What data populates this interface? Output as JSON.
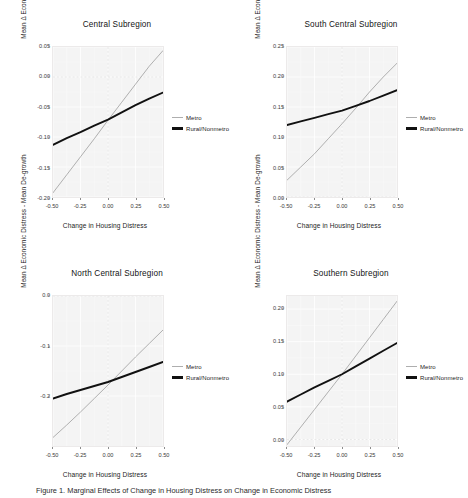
{
  "figure": {
    "background": "#ffffff",
    "caption": "Figure 1. Marginal Effects of Change in Housing Distress on Change in Economic Distress"
  },
  "legend": {
    "position": "right",
    "entries": [
      {
        "label": "Metro",
        "color": "#aeaeae",
        "style": "thin"
      },
      {
        "label": "Rural/Nonmetro",
        "color": "#111111",
        "style": "thick"
      }
    ]
  },
  "axis_titles": {
    "x": "Change in Housing Distress",
    "y": "Mean Δ Economic Distress - Mean De-growth"
  },
  "chart_data": [
    {
      "type": "line",
      "title": "Central Subregion",
      "xlabel": "Change in Housing Distress",
      "ylabel": "Mean Δ Economic Distress - Mean De-growth",
      "xlim": [
        -0.5,
        0.5
      ],
      "ylim": [
        -0.2,
        0.05
      ],
      "xticks": [
        "-0.50",
        "-0.25",
        "0.00",
        "0.25",
        "0.50"
      ],
      "xtickvalues": [
        -0.5,
        -0.25,
        0,
        0.25,
        0.5
      ],
      "yticks": [
        "0.05",
        "0.00",
        "-0.05",
        "-0.10",
        "-0.15",
        "-0.20"
      ],
      "ytickvalues": [
        0.05,
        0,
        -0.05,
        -0.1,
        -0.15,
        -0.2
      ],
      "grid": true,
      "legend": "right",
      "series": [
        {
          "name": "Metro",
          "color": "#aeaeae",
          "x": [
            -0.5,
            -0.375,
            -0.25,
            -0.125,
            0.0,
            0.125,
            0.25,
            0.375,
            0.5
          ],
          "values": [
            -0.193,
            -0.163,
            -0.133,
            -0.103,
            -0.072,
            -0.042,
            -0.012,
            0.018,
            0.044
          ]
        },
        {
          "name": "Rural/Nonmetro",
          "color": "#111111",
          "x": [
            -0.5,
            -0.375,
            -0.25,
            -0.125,
            0.0,
            0.125,
            0.25,
            0.375,
            0.5
          ],
          "values": [
            -0.113,
            -0.102,
            -0.092,
            -0.081,
            -0.071,
            -0.059,
            -0.047,
            -0.036,
            -0.026
          ]
        }
      ]
    },
    {
      "type": "line",
      "title": "South Central Subregion",
      "xlabel": "Change in Housing Distress",
      "ylabel": "Mean Δ Economic Distress - Mean De-growth",
      "xlim": [
        -0.5,
        0.5
      ],
      "ylim": [
        0.0,
        0.25
      ],
      "xticks": [
        "-0.50",
        "-0.25",
        "0.00",
        "0.25",
        "0.50"
      ],
      "xtickvalues": [
        -0.5,
        -0.25,
        0,
        0.25,
        0.5
      ],
      "yticks": [
        "0.25",
        "0.20",
        "0.15",
        "0.10",
        "0.05",
        "0.00"
      ],
      "ytickvalues": [
        0.25,
        0.2,
        0.15,
        0.1,
        0.05,
        0.0
      ],
      "grid": true,
      "legend": "right",
      "series": [
        {
          "name": "Metro",
          "color": "#aeaeae",
          "x": [
            -0.5,
            -0.375,
            -0.25,
            -0.125,
            0.0,
            0.125,
            0.25,
            0.375,
            0.5
          ],
          "values": [
            0.028,
            0.05,
            0.072,
            0.097,
            0.122,
            0.148,
            0.175,
            0.2,
            0.223
          ]
        },
        {
          "name": "Rural/Nonmetro",
          "color": "#111111",
          "x": [
            -0.5,
            -0.375,
            -0.25,
            -0.125,
            0.0,
            0.125,
            0.25,
            0.375,
            0.5
          ],
          "values": [
            0.12,
            0.126,
            0.132,
            0.138,
            0.144,
            0.152,
            0.16,
            0.169,
            0.178
          ]
        }
      ]
    },
    {
      "type": "line",
      "title": "North Central Subregion",
      "xlabel": "Change in Housing Distress",
      "ylabel": "Mean Δ Economic Distress - Mean De-growth",
      "xlim": [
        -0.5,
        0.5
      ],
      "ylim": [
        -0.3,
        0.0
      ],
      "xticks": [
        "-0.50",
        "-0.25",
        "0.00",
        "0.25",
        "0.50"
      ],
      "xtickvalues": [
        -0.5,
        -0.25,
        0,
        0.25,
        0.5
      ],
      "yticks": [
        "0.0",
        "-0.1",
        "-0.2"
      ],
      "ytickvalues": [
        0.0,
        -0.1,
        -0.2
      ],
      "grid": true,
      "legend": "right",
      "series": [
        {
          "name": "Metro",
          "color": "#aeaeae",
          "x": [
            -0.5,
            -0.375,
            -0.25,
            -0.125,
            0.0,
            0.125,
            0.25,
            0.375,
            0.5
          ],
          "values": [
            -0.283,
            -0.258,
            -0.232,
            -0.205,
            -0.178,
            -0.15,
            -0.122,
            -0.095,
            -0.068
          ]
        },
        {
          "name": "Rural/Nonmetro",
          "color": "#111111",
          "x": [
            -0.5,
            -0.375,
            -0.25,
            -0.125,
            0.0,
            0.125,
            0.25,
            0.375,
            0.5
          ],
          "values": [
            -0.205,
            -0.196,
            -0.188,
            -0.18,
            -0.172,
            -0.162,
            -0.152,
            -0.142,
            -0.132
          ]
        }
      ]
    },
    {
      "type": "line",
      "title": "Southern Subregion",
      "xlabel": "Change in Housing Distress",
      "ylabel": "Mean Δ Economic Distress - Mean De-growth",
      "xlim": [
        -0.5,
        0.5
      ],
      "ylim": [
        -0.01,
        0.22
      ],
      "xticks": [
        "-0.50",
        "-0.25",
        "0.00",
        "0.25",
        "0.50"
      ],
      "xtickvalues": [
        -0.5,
        -0.25,
        0,
        0.25,
        0.5
      ],
      "yticks": [
        "0.20",
        "0.15",
        "0.10",
        "0.05",
        "0.00"
      ],
      "ytickvalues": [
        0.2,
        0.15,
        0.1,
        0.05,
        0.0
      ],
      "grid": true,
      "legend": "right",
      "series": [
        {
          "name": "Metro",
          "color": "#aeaeae",
          "x": [
            -0.5,
            -0.375,
            -0.25,
            -0.125,
            0.0,
            0.125,
            0.25,
            0.375,
            0.5
          ],
          "values": [
            -0.008,
            0.019,
            0.046,
            0.073,
            0.1,
            0.128,
            0.156,
            0.184,
            0.212
          ]
        },
        {
          "name": "Rural/Nonmetro",
          "color": "#111111",
          "x": [
            -0.5,
            -0.375,
            -0.25,
            -0.125,
            0.0,
            0.125,
            0.25,
            0.375,
            0.5
          ],
          "values": [
            0.058,
            0.069,
            0.08,
            0.09,
            0.1,
            0.112,
            0.124,
            0.136,
            0.148
          ]
        }
      ]
    }
  ]
}
